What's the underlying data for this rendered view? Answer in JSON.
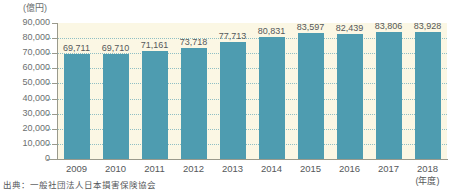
{
  "chart_data": {
    "type": "bar",
    "title": "",
    "subtitle": "",
    "xlabel": "(年度)",
    "ylabel": "(億円)",
    "categories": [
      "2009",
      "2010",
      "2011",
      "2012",
      "2013",
      "2014",
      "2015",
      "2016",
      "2017",
      "2018"
    ],
    "values": [
      69711,
      69710,
      71161,
      73718,
      77713,
      80831,
      83597,
      82439,
      83806,
      83928
    ],
    "value_labels": [
      "69,711",
      "69,710",
      "71,161",
      "73,718",
      "77,713",
      "80,831",
      "83,597",
      "82,439",
      "83,806",
      "83,928"
    ],
    "ylim": [
      0,
      90000
    ],
    "ytick_values": [
      90000,
      80000,
      70000,
      60000,
      50000,
      40000,
      30000,
      20000,
      10000,
      0
    ],
    "ytick_labels": [
      "90,000",
      "80,000",
      "70,000",
      "60,000",
      "50,000",
      "40,000",
      "30,000",
      "20,000",
      "10,000",
      "0"
    ],
    "grid": true,
    "legend": false,
    "bar_color": "#4e9cb0",
    "plot_background": "#fbf7e4",
    "gridline_color": "#8fbfc4",
    "axis_color": "#9a9a8c",
    "text_color": "#55585a"
  },
  "source": {
    "label": "出典：一般社団法人日本損害保険協会"
  }
}
